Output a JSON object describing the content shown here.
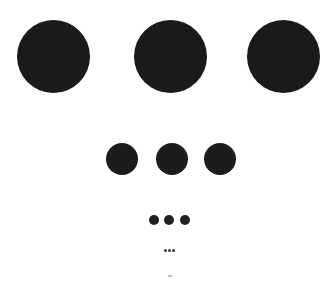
{
  "canvas": {
    "width": 335,
    "height": 292,
    "background": "#ffffff"
  },
  "rows": [
    {
      "name": "large",
      "color": "#1a1a1a",
      "diameter": 73,
      "cy": 56,
      "cx": [
        53,
        170,
        283
      ]
    },
    {
      "name": "medium",
      "color": "#1c1c1c",
      "diameter": 32,
      "cy": 159,
      "cx": [
        122,
        172,
        220
      ]
    },
    {
      "name": "small",
      "color": "#202020",
      "diameter": 10,
      "cy": 220,
      "cx": [
        154,
        169,
        185
      ]
    },
    {
      "name": "tiny",
      "color": "#3a3a3a",
      "diameter": 3,
      "cy": 250,
      "cx": [
        165,
        169,
        173
      ]
    },
    {
      "name": "micro",
      "color": "#b8b8b8",
      "diameter": 1.4,
      "cy": 276,
      "cx": [
        168.5,
        170,
        171.5
      ]
    }
  ]
}
